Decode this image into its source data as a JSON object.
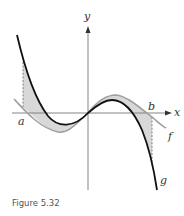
{
  "figure": {
    "caption": "Figure 5.32",
    "axes": {
      "x_label": "x",
      "y_label": "y"
    },
    "bounds": {
      "a_label": "a",
      "b_label": "b"
    },
    "curves": [
      {
        "name": "f",
        "label": "f",
        "color": "#a0a0a0",
        "description": "gray cubic-like curve, above g between 0 and b"
      },
      {
        "name": "g",
        "label": "g",
        "color": "#111111",
        "description": "black cubic curve, above f between a and 0"
      }
    ],
    "shaded_region": {
      "color": "#d8d8d8",
      "description": "region between f and g from x=a to x=b"
    }
  }
}
